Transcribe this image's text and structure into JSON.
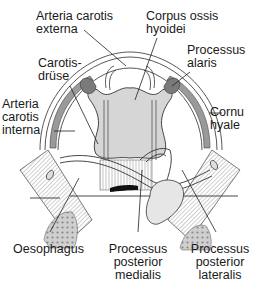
{
  "figure": {
    "colors": {
      "background": "#ffffff",
      "ink": "#1a1a1a",
      "bone_fill": "#d9d9d9",
      "bone_shade": "#a8a8a8",
      "dark_shade": "#555555",
      "leader_line": "#333333"
    }
  },
  "labels": {
    "arteria_carotis_externa": {
      "line1": "Arteria carotis",
      "line2": "externa"
    },
    "corpus_ossis_hyoidei": {
      "line1": "Corpus ossis",
      "line2": "hyoidei"
    },
    "carotisdruese": {
      "line1": "Carotis-",
      "line2": "drüse"
    },
    "processus_alaris": {
      "line1": "Processus",
      "line2": "alaris"
    },
    "arteria_carotis_interna": {
      "line1": "Arteria",
      "line2": "carotis",
      "line3": "interna"
    },
    "cornu_hyale": {
      "line1": "Cornu",
      "line2": "hyale"
    },
    "oesophagus": {
      "line1": "Oesophagus"
    },
    "processus_posterior_medialis": {
      "line1": "Processus",
      "line2": "posterior",
      "line3": "medialis"
    },
    "processus_posterior_lateralis": {
      "line1": "Processus",
      "line2": "posterior",
      "line3": "lateralis"
    }
  }
}
